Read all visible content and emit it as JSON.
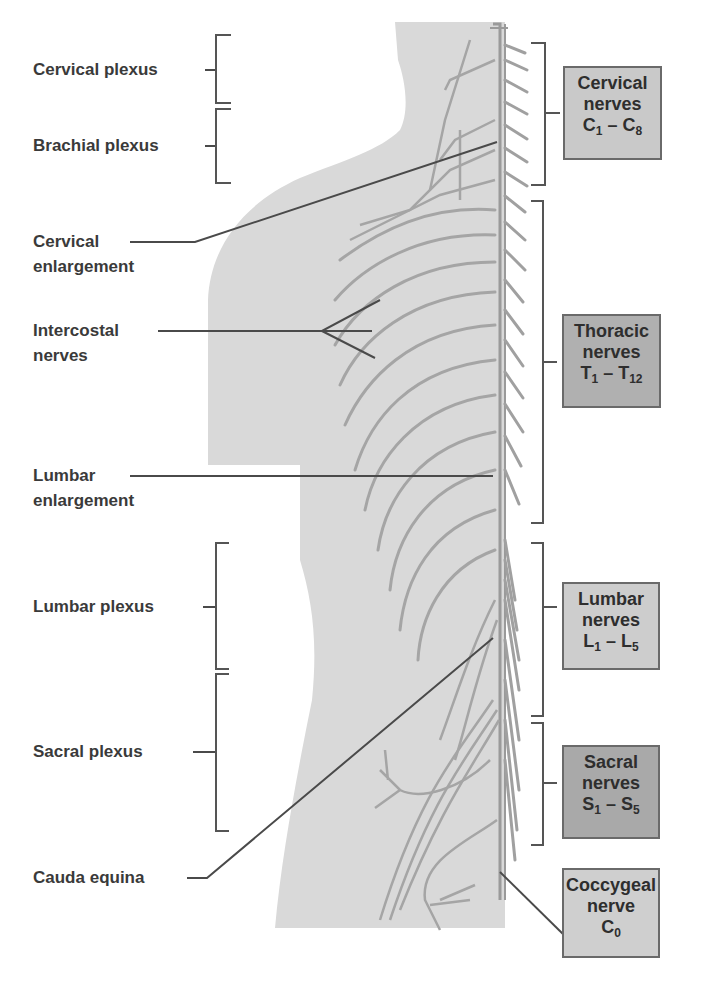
{
  "figure": {
    "colors": {
      "body_fill": "#d9d9d9",
      "nerve_stroke": "#9a9a9a",
      "leader_line": "#4a4a4a",
      "bracket": "#555555",
      "box_light": "#cfcfcf",
      "box_mid": "#bdbdbd",
      "box_dark": "#a8a8a8"
    }
  },
  "left_labels": {
    "cervical_plexus": "Cervical plexus",
    "brachial_plexus": "Brachial plexus",
    "cervical_enlargement_1": "Cervical",
    "cervical_enlargement_2": "enlargement",
    "intercostal_1": "Intercostal",
    "intercostal_2": "nerves",
    "lumbar_enlargement_1": "Lumbar",
    "lumbar_enlargement_2": "enlargement",
    "lumbar_plexus": "Lumbar plexus",
    "sacral_plexus": "Sacral plexus",
    "cauda_equina": "Cauda equina"
  },
  "right_boxes": {
    "cervical": {
      "line1": "Cervical",
      "line2": "nerves",
      "from_letter": "C",
      "from_num": "1",
      "dash": " – ",
      "to_letter": "C",
      "to_num": "8"
    },
    "thoracic": {
      "line1": "Thoracic",
      "line2": "nerves",
      "from_letter": "T",
      "from_num": "1",
      "dash": " – ",
      "to_letter": "T",
      "to_num": "12"
    },
    "lumbar": {
      "line1": "Lumbar",
      "line2": "nerves",
      "from_letter": "L",
      "from_num": "1",
      "dash": " – ",
      "to_letter": "L",
      "to_num": "5"
    },
    "sacral": {
      "line1": "Sacral",
      "line2": "nerves",
      "from_letter": "S",
      "from_num": "1",
      "dash": " – ",
      "to_letter": "S",
      "to_num": "5"
    },
    "coccygeal": {
      "line1": "Coccygeal",
      "line2": "nerve",
      "letter": "C",
      "num": "0"
    }
  }
}
